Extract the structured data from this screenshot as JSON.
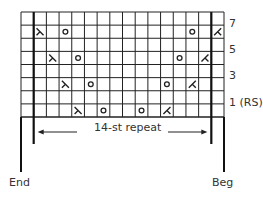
{
  "chart": {
    "columns": 16,
    "rows": 8,
    "repeat_label": "14-st repeat",
    "repeat_start_col": 1,
    "repeat_end_col": 15,
    "row_labels": [
      {
        "row": 1,
        "text": "7"
      },
      {
        "row": 3,
        "text": "5"
      },
      {
        "row": 5,
        "text": "3"
      },
      {
        "row": 7,
        "text": "1 (RS)"
      }
    ],
    "end_label": "End",
    "beg_label": "Beg",
    "symbols": [
      {
        "row": 1,
        "col": 1,
        "type": "ssk"
      },
      {
        "row": 1,
        "col": 3,
        "type": "yo"
      },
      {
        "row": 1,
        "col": 13,
        "type": "yo"
      },
      {
        "row": 1,
        "col": 15,
        "type": "k2tog"
      },
      {
        "row": 3,
        "col": 2,
        "type": "ssk"
      },
      {
        "row": 3,
        "col": 4,
        "type": "yo"
      },
      {
        "row": 3,
        "col": 12,
        "type": "yo"
      },
      {
        "row": 3,
        "col": 14,
        "type": "k2tog"
      },
      {
        "row": 5,
        "col": 3,
        "type": "ssk"
      },
      {
        "row": 5,
        "col": 5,
        "type": "yo"
      },
      {
        "row": 5,
        "col": 11,
        "type": "yo"
      },
      {
        "row": 5,
        "col": 13,
        "type": "k2tog"
      },
      {
        "row": 7,
        "col": 4,
        "type": "ssk"
      },
      {
        "row": 7,
        "col": 6,
        "type": "yo"
      },
      {
        "row": 7,
        "col": 9,
        "type": "yo"
      },
      {
        "row": 7,
        "col": 11,
        "type": "k2tog"
      }
    ]
  }
}
